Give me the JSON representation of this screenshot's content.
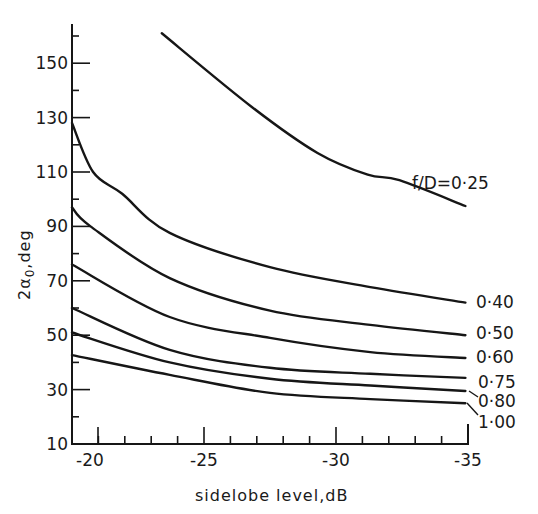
{
  "chart_data": {
    "type": "line",
    "title": "",
    "xlabel": "sidelobe level,dB",
    "ylabel": "2α0,deg",
    "xlim": [
      -20,
      -35
    ],
    "ylim": [
      10,
      164
    ],
    "x_ticks": [
      -20,
      -25,
      -30,
      -35
    ],
    "x_tick_labels": [
      "-20",
      "-25",
      "-30",
      "-35"
    ],
    "y_ticks": [
      10,
      30,
      50,
      70,
      90,
      110,
      130,
      150
    ],
    "y_tick_labels": [
      "10",
      "30",
      "50",
      "70",
      "90",
      "110",
      "130",
      "150"
    ],
    "grid": false,
    "legend": "inline labels at right end of curves",
    "series": [
      {
        "name": "f/D=0·25",
        "label": "f/D=0·25",
        "x": [
          -23.4,
          -26.8,
          -29.3,
          -31.2,
          -32.4,
          -34.9
        ],
        "y": [
          161,
          134,
          117,
          109,
          107,
          97.5
        ]
      },
      {
        "name": "0·40",
        "label": "0·40",
        "x": [
          -20,
          -20.8,
          -21.9,
          -23.7,
          -27.5,
          -31.3,
          -34.9
        ],
        "y": [
          128,
          110,
          102,
          87.6,
          75,
          67.7,
          62
        ]
      },
      {
        "name": "0·50",
        "label": "0·50",
        "x": [
          -20,
          -20.7,
          -23.7,
          -27.5,
          -31.3,
          -34.9
        ],
        "y": [
          97,
          90,
          71,
          59,
          53.8,
          50
        ]
      },
      {
        "name": "0·60",
        "label": "0·60",
        "x": [
          -20,
          -23.7,
          -27.5,
          -31.3,
          -34.9
        ],
        "y": [
          76,
          56.7,
          49,
          43.8,
          41.6
        ]
      },
      {
        "name": "0·75",
        "label": "0·75",
        "x": [
          -20,
          -23.7,
          -27.5,
          -31.3,
          -34.9
        ],
        "y": [
          60,
          44.6,
          38,
          35.8,
          34.3
        ]
      },
      {
        "name": "0·80",
        "label": "0·80",
        "x": [
          -20,
          -23.7,
          -27.5,
          -31.3,
          -34.9
        ],
        "y": [
          51,
          40,
          34,
          31.5,
          29.5
        ]
      },
      {
        "name": "1·00",
        "label": "1·00",
        "x": [
          -20,
          -23.7,
          -27.5,
          -31.3,
          -34.9
        ],
        "y": [
          42.7,
          35.4,
          28.8,
          26.5,
          25
        ]
      }
    ]
  },
  "labels": {
    "xlabel": "sidelobe level,dB",
    "ylabel_main": "2α",
    "ylabel_sub": "0",
    "ylabel_tail": ",deg"
  },
  "colors": {
    "ink": "#161616",
    "background": "#ffffff"
  }
}
